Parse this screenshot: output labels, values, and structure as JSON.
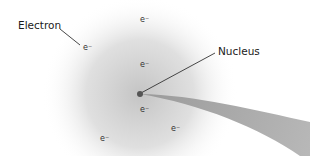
{
  "labels": {
    "electron": "Electron",
    "nucleus": "Nucleus"
  },
  "electron_symbol": "e⁻",
  "electrons": [
    {
      "x": 83,
      "y": 50
    },
    {
      "x": 140,
      "y": 22
    },
    {
      "x": 140,
      "y": 67
    },
    {
      "x": 140,
      "y": 112
    },
    {
      "x": 100,
      "y": 141
    },
    {
      "x": 171,
      "y": 131
    }
  ],
  "colors": {
    "cloud": "#c8c8c8",
    "wedge": "#a8a8a8",
    "nucleus": "#555555",
    "line": "#333333"
  }
}
